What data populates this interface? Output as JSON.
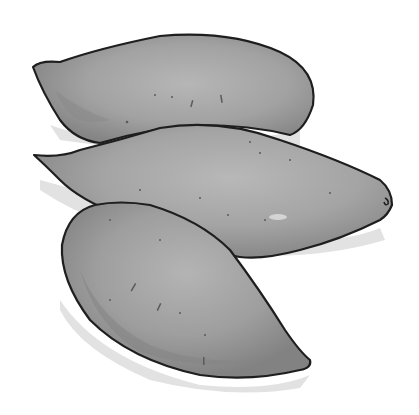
{
  "image": {
    "subject": "Three sweet potatoes illustration",
    "style": "grayscale ink drawing",
    "colors": {
      "background": "#ffffff",
      "outline": "#1e1e1e",
      "skin_base": "#9a9a9a",
      "skin_light": "#b4b4b4",
      "skin_dark": "#7e7e7e",
      "shadow": "#dcdcdc",
      "speck": "#5a5a5a"
    }
  }
}
